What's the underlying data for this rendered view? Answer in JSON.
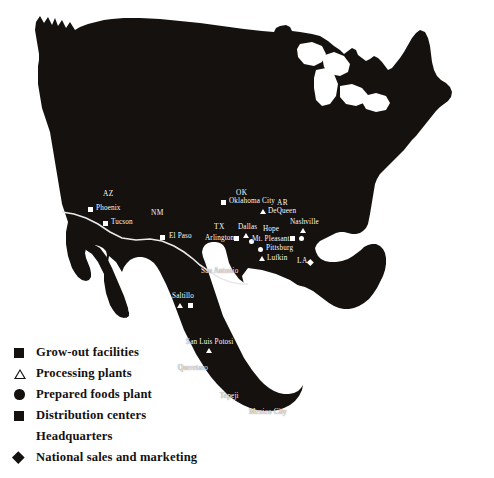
{
  "map": {
    "title": "North America operations map",
    "landmass_color": "#14110f",
    "ocean_color": "#ffffff",
    "border_color": "#e8e8e8",
    "label_color": "#ffffff",
    "watermark": ""
  },
  "legend": {
    "items": [
      {
        "symbol": "filled-square",
        "label": "Grow-out facilities"
      },
      {
        "symbol": "open-triangle",
        "label": "Processing plants"
      },
      {
        "symbol": "filled-circle",
        "label": "Prepared foods plant"
      },
      {
        "symbol": "filled-square",
        "label": "Distribution centers"
      },
      {
        "symbol": "none",
        "label": "Headquarters"
      },
      {
        "symbol": "filled-diamond",
        "label": "National sales and marketing"
      }
    ]
  },
  "state_labels": [
    {
      "id": "az",
      "text": "AZ"
    },
    {
      "id": "nm",
      "text": "NM"
    },
    {
      "id": "ok",
      "text": "OK"
    },
    {
      "id": "ar",
      "text": "AR"
    },
    {
      "id": "tx",
      "text": "TX"
    },
    {
      "id": "la",
      "text": "LA"
    }
  ],
  "cities": [
    {
      "id": "phoenix",
      "text": "Phoenix"
    },
    {
      "id": "tucson",
      "text": "Tucson"
    },
    {
      "id": "el-paso",
      "text": "El Paso"
    },
    {
      "id": "oklahoma-city",
      "text": "Oklahoma City"
    },
    {
      "id": "de-queen",
      "text": "DeQueen"
    },
    {
      "id": "dallas",
      "text": "Dallas"
    },
    {
      "id": "arlington",
      "text": "Arlington"
    },
    {
      "id": "hope",
      "text": "Hope"
    },
    {
      "id": "nashville",
      "text": "Nashville"
    },
    {
      "id": "mt-pleasant",
      "text": "Mt. Pleasant"
    },
    {
      "id": "pittsburg",
      "text": "Pittsburg"
    },
    {
      "id": "lufkin",
      "text": "Lufkin"
    },
    {
      "id": "san-antonio",
      "text": "San Antonio"
    },
    {
      "id": "saltillo",
      "text": "Saltillo"
    },
    {
      "id": "san-luis-potosi",
      "text": "San Luis Potosi"
    },
    {
      "id": "queretaro",
      "text": "Queretaro"
    },
    {
      "id": "tepeji",
      "text": "Tepeji"
    },
    {
      "id": "mexico-city",
      "text": "Mexico City"
    }
  ]
}
